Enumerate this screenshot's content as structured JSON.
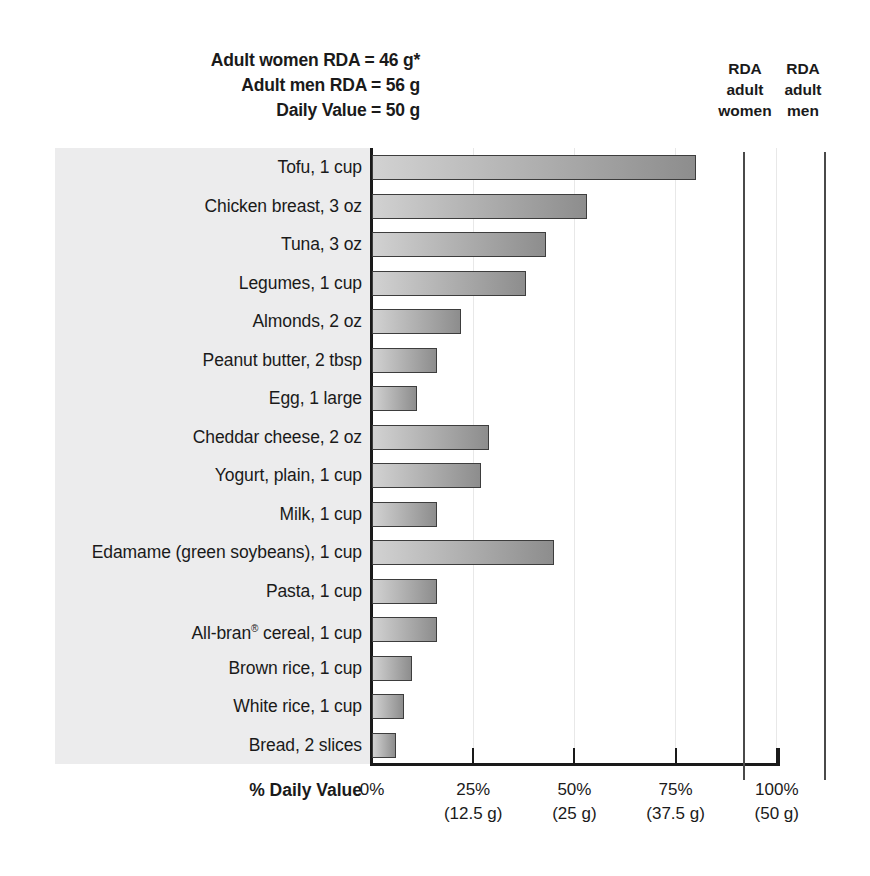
{
  "header": {
    "lines": [
      "Adult women RDA = 46 g*",
      "Adult men RDA = 56 g",
      "Daily Value = 50 g"
    ]
  },
  "reference_lines": [
    {
      "id": "women",
      "caption": [
        "RDA",
        "adult",
        "women"
      ],
      "value_pct": 92,
      "grams": 46
    },
    {
      "id": "men",
      "caption": [
        "RDA",
        "adult",
        "men"
      ],
      "value_pct": 112,
      "grams": 56
    }
  ],
  "axis": {
    "title": "% Daily Value",
    "ticks": [
      {
        "pct": "0%",
        "grams": ""
      },
      {
        "pct": "25%",
        "grams": "(12.5 g)"
      },
      {
        "pct": "50%",
        "grams": "(25 g)"
      },
      {
        "pct": "75%",
        "grams": "(37.5 g)"
      },
      {
        "pct": "100%",
        "grams": "(50 g)"
      }
    ]
  },
  "colors": {
    "bar_light": "#d2d2d2",
    "bar_dark": "#8d8d8d",
    "bar_outline": "#3d3d3d",
    "panel": "#ececed",
    "axis": "#1a1a1a",
    "gridline": "#e8e8e8",
    "ref_line": "#4a4a4a"
  },
  "chart_data": {
    "type": "bar",
    "orientation": "horizontal",
    "title": "",
    "xlabel": "% Daily Value",
    "ylabel": "",
    "xlim": [
      0,
      100
    ],
    "grid": true,
    "legend": "none",
    "categories": [
      "Tofu, 1 cup",
      "Chicken breast, 3 oz",
      "Tuna, 3 oz",
      "Legumes, 1 cup",
      "Almonds, 2 oz",
      "Peanut butter, 2 tbsp",
      "Egg, 1 large",
      "Cheddar cheese, 2 oz",
      "Yogurt, plain, 1 cup",
      "Milk, 1 cup",
      "Edamame (green soybeans), 1 cup",
      "Pasta, 1 cup",
      "All-bran® cereal, 1 cup",
      "Brown rice, 1 cup",
      "White rice, 1 cup",
      "Bread, 2 slices"
    ],
    "values": [
      80,
      53,
      43,
      38,
      22,
      16,
      11,
      29,
      27,
      16,
      45,
      16,
      16,
      10,
      8,
      6
    ],
    "annotations": [
      "Adult women RDA = 46 g*",
      "Adult men RDA = 56 g",
      "Daily Value = 50 g",
      "RDA adult women",
      "RDA adult men"
    ]
  },
  "rows": [
    {
      "label_html": "Tofu, 1 cup",
      "value": 80
    },
    {
      "label_html": "Chicken breast, 3 oz",
      "value": 53
    },
    {
      "label_html": "Tuna, 3 oz",
      "value": 43
    },
    {
      "label_html": "Legumes, 1 cup",
      "value": 38
    },
    {
      "label_html": "Almonds, 2 oz",
      "value": 22
    },
    {
      "label_html": "Peanut butter, 2 tbsp",
      "value": 16
    },
    {
      "label_html": "Egg, 1 large",
      "value": 11
    },
    {
      "label_html": "Cheddar cheese, 2 oz",
      "value": 29
    },
    {
      "label_html": "Yogurt, plain, 1 cup",
      "value": 27
    },
    {
      "label_html": "Milk, 1 cup",
      "value": 16
    },
    {
      "label_html": "Edamame (green soybeans), 1 cup",
      "value": 45
    },
    {
      "label_html": "Pasta, 1 cup",
      "value": 16
    },
    {
      "label_html": "All-bran<sup>®</sup> cereal, 1 cup",
      "value": 16
    },
    {
      "label_html": "Brown rice, 1 cup",
      "value": 10
    },
    {
      "label_html": "White rice, 1 cup",
      "value": 8
    },
    {
      "label_html": "Bread, 2 slices",
      "value": 6
    }
  ]
}
